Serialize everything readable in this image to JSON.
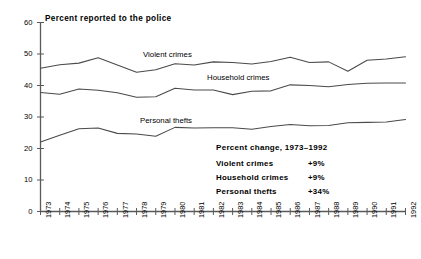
{
  "chart_data": {
    "type": "line",
    "title": "Percent reported to the police",
    "xlabel": "",
    "ylabel": "",
    "ylim": [
      0,
      60
    ],
    "yticks": [
      0,
      10,
      20,
      30,
      40,
      50,
      60
    ],
    "grid": false,
    "legend_position": "inline-series-labels",
    "x": [
      1973,
      1974,
      1975,
      1976,
      1977,
      1978,
      1979,
      1980,
      1981,
      1982,
      1983,
      1984,
      1985,
      1986,
      1987,
      1988,
      1989,
      1990,
      1991,
      1992
    ],
    "categories": [
      "1973",
      "1974",
      "1975",
      "1976",
      "1977",
      "1978",
      "1979",
      "1980",
      "1981",
      "1982",
      "1983",
      "1984",
      "1985",
      "1986",
      "1987",
      "1988",
      "1989",
      "1990",
      "1991",
      "1992"
    ],
    "series": [
      {
        "name": "Violent crimes",
        "values": [
          45.5,
          46.6,
          47.1,
          48.8,
          46.5,
          44.2,
          45.0,
          46.9,
          46.5,
          47.5,
          47.3,
          46.8,
          47.6,
          49.0,
          47.3,
          47.5,
          44.5,
          48.0,
          48.4,
          49.1
        ]
      },
      {
        "name": "Household crimes",
        "values": [
          37.8,
          37.2,
          38.9,
          38.5,
          37.7,
          36.3,
          36.4,
          39.1,
          38.6,
          38.6,
          37.1,
          38.2,
          38.3,
          40.2,
          40.0,
          39.6,
          40.3,
          40.7,
          40.8,
          40.8
        ]
      },
      {
        "name": "Personal thefts",
        "values": [
          22.1,
          24.2,
          26.3,
          26.5,
          24.8,
          24.6,
          23.9,
          26.7,
          26.5,
          26.6,
          26.6,
          26.1,
          27.0,
          27.6,
          27.2,
          27.3,
          28.2,
          28.3,
          28.4,
          29.2
        ]
      }
    ]
  },
  "series_labels": [
    {
      "text": "Violent crimes",
      "left": 143,
      "top": 50
    },
    {
      "text": "Household crimes",
      "left": 207,
      "top": 73
    },
    {
      "text": "Personal thefts",
      "left": 140,
      "top": 116
    }
  ],
  "annotation": {
    "title": "Percent change, 1973–1992",
    "rows": [
      {
        "name": "Violent crimes",
        "value": "+9%"
      },
      {
        "name": "Household crimes",
        "value": "+9%"
      },
      {
        "name": "Personal thefts",
        "value": "+34%"
      }
    ]
  },
  "colors": {
    "line": "#4a4a4a",
    "axis": "#5a5a5a",
    "text": "#000000",
    "background": "#ffffff"
  }
}
